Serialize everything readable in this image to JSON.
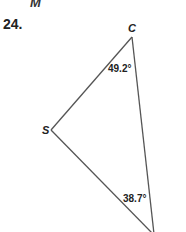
{
  "previous_label": "M",
  "problem": {
    "number": "24.",
    "vertices": {
      "C": "C",
      "S": "S"
    },
    "angles": {
      "at_C": "49.2°",
      "at_bottom": "38.7°"
    },
    "colors": {
      "stroke": "#555555",
      "text": "#222222"
    }
  }
}
